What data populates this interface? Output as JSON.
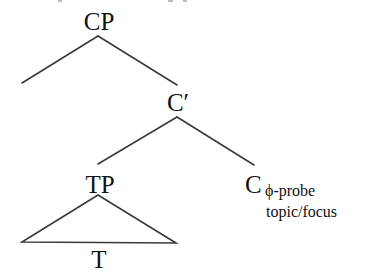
{
  "diagram": {
    "type": "syntax-tree",
    "nodes": {
      "root": {
        "label": "CP"
      },
      "c_bar": {
        "label": "C′"
      },
      "tp": {
        "label": "TP"
      },
      "c_head": {
        "label": "C",
        "subscript": "ϕ-probe",
        "subscript2": "topic/focus"
      },
      "t": {
        "label": "T"
      }
    },
    "edges": [
      {
        "from": "CP",
        "to": "(empty specifier)"
      },
      {
        "from": "CP",
        "to": "C′"
      },
      {
        "from": "C′",
        "to": "TP"
      },
      {
        "from": "C′",
        "to": "C"
      },
      {
        "from": "TP",
        "to": "T",
        "style": "triangle"
      }
    ],
    "colors": {
      "text": "#111111",
      "lines": "#3a3a3a",
      "background": "#ffffff"
    }
  }
}
